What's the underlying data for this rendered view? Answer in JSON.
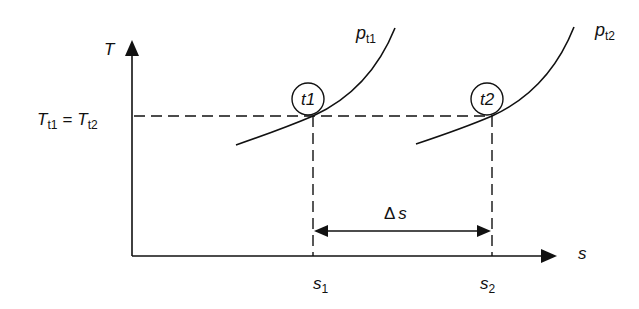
{
  "diagram": {
    "type": "T-s diagram",
    "axes": {
      "y_label": "T",
      "x_label": "s"
    },
    "temperature_label": {
      "left": "T",
      "left_sub": "t1",
      "equals": "=",
      "right": "T",
      "right_sub": "t2"
    },
    "curves": [
      {
        "name": "p",
        "sub": "t1"
      },
      {
        "name": "p",
        "sub": "t2"
      }
    ],
    "points": [
      {
        "label": "t1"
      },
      {
        "label": "t2"
      }
    ],
    "x_ticks": [
      {
        "name": "s",
        "sub": "1"
      },
      {
        "name": "s",
        "sub": "2"
      }
    ],
    "delta": {
      "symbol": "Δ",
      "var": "s"
    },
    "colors": {
      "stroke": "#111111",
      "background": "#ffffff"
    }
  }
}
